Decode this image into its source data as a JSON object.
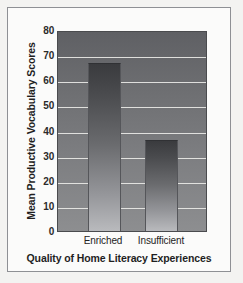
{
  "chart_data": {
    "type": "bar",
    "title": "",
    "categories": [
      "Enriched",
      "Insufficient"
    ],
    "values": [
      67,
      36
    ],
    "xlabel": "Quality of Home Literacy Experiences",
    "ylabel": "Mean Productive Vocabulary Scores",
    "ylim": [
      0,
      80
    ],
    "yticks": [
      0,
      10,
      20,
      30,
      40,
      50,
      60,
      70,
      80
    ],
    "ytick_labels": [
      "0",
      "10",
      "20",
      "30",
      "40",
      "50",
      "60",
      "70",
      "80"
    ],
    "grid": true,
    "grid_color": "#e9e9e6",
    "legend": null,
    "bar_color": "#6a6b6e",
    "plot_background": "#6d6e71",
    "page_background": "#f3f3f1"
  }
}
